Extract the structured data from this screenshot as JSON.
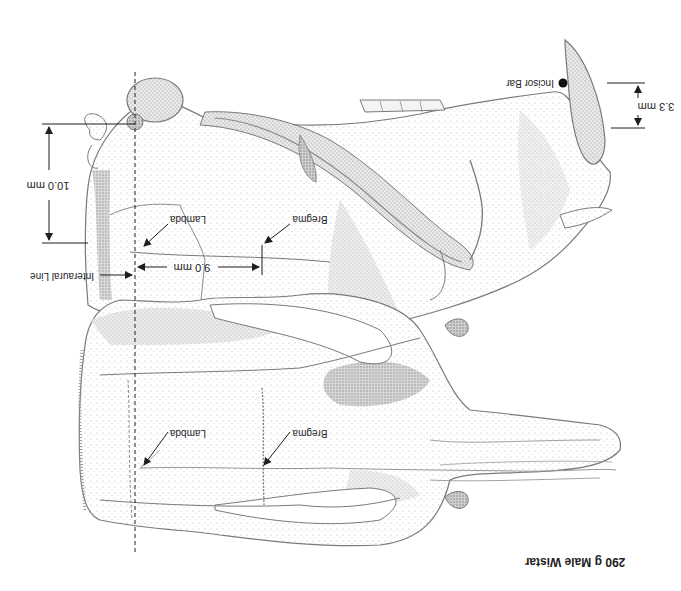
{
  "figure": {
    "title": "290 g Male Wistar",
    "orientation": "rotated 180 degrees",
    "colors": {
      "outline": "#7a7a7a",
      "stipple": "#9a9a9a",
      "shade": "#b8b8b8",
      "ink": "#1e1e1e",
      "background": "#ffffff"
    }
  },
  "lateral_view": {
    "labels": {
      "interaural_line": "Interaural Line",
      "lambda": "Lambda",
      "bregma": "Bregma",
      "incisor_bar": "Incisor Bar"
    },
    "dimensions": {
      "height": "10.0 mm",
      "bregma_to_interaural": "9.0 mm",
      "incisor_bar_offset": "3.3 mm"
    }
  },
  "dorsal_view": {
    "labels": {
      "lambda": "Lambda",
      "bregma": "Bregma"
    }
  }
}
